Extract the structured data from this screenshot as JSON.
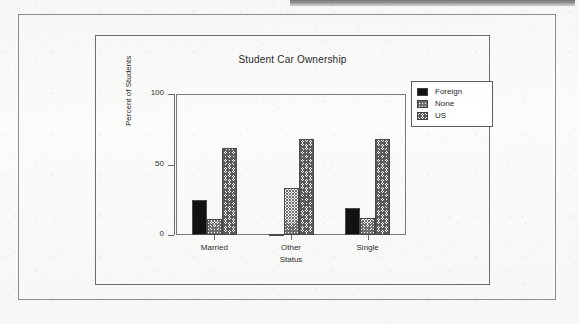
{
  "document": {
    "top_band": "cropped-gray-band"
  },
  "chart_data": {
    "type": "bar",
    "title": "Student Car Ownership",
    "xlabel": "Status",
    "ylabel": "Percent of Students",
    "categories": [
      "Married",
      "Other",
      "Single"
    ],
    "series": [
      {
        "name": "Foreign",
        "fill": "solid-black",
        "values": [
          25,
          0,
          19
        ]
      },
      {
        "name": "None",
        "fill": "light-crosshatch",
        "values": [
          11,
          33,
          12
        ]
      },
      {
        "name": "US",
        "fill": "dense-crosshatch",
        "values": [
          62,
          68,
          68
        ]
      }
    ],
    "ylim": [
      0,
      100
    ],
    "yticks": [
      0,
      50,
      100
    ],
    "ytick_labels": [
      "0",
      "50",
      "100"
    ],
    "grid": false,
    "legend_position": "top-right",
    "colors": {
      "foreign": "#121212",
      "none": "#6f6f6f",
      "us": "#5a5a5a",
      "axis": "#6b6b6b",
      "text": "#2e2e2e"
    }
  }
}
